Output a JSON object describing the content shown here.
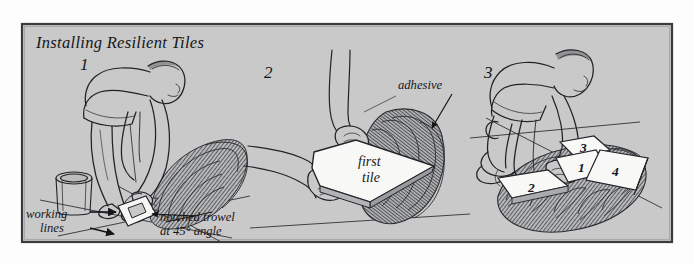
{
  "figure": {
    "title": "Installing Resilient Tiles",
    "kind": "instructional-line-drawing",
    "panel_count": 3,
    "colors": {
      "page": "#fdfdfd",
      "panel_background": "#c9c9c9",
      "frame_line": "#3a3b3f",
      "ink": "#202227",
      "tile_fill": "#f7f7f5",
      "adhesive_shadow": "#6f7175"
    }
  },
  "panels": [
    {
      "number": "1",
      "subject": "worker-spreading-adhesive",
      "labels": [
        {
          "name": "working-lines",
          "text": "working\nlines",
          "line1": "working",
          "line2": "lines",
          "arrows": 2
        },
        {
          "name": "notched-trowel",
          "text": "notched trowel\nat 45° angle",
          "line1": "notched trowel",
          "line2": "at 45° angle",
          "arrows": 1
        }
      ],
      "objects": [
        "bending-worker",
        "adhesive-bucket",
        "notched-trowel",
        "chalk-working-lines",
        "troweled-adhesive"
      ]
    },
    {
      "number": "2",
      "subject": "hands-placing-first-tile",
      "labels": [
        {
          "name": "adhesive",
          "text": "adhesive",
          "line1": "adhesive",
          "arrows": 1
        }
      ],
      "tiles": [
        {
          "label_line1": "first",
          "label_line2": "tile"
        }
      ],
      "objects": [
        "two-hands",
        "first-tile",
        "troweled-adhesive"
      ]
    },
    {
      "number": "3",
      "subject": "kneeling-worker-laying-tiles",
      "labels": [],
      "tiles": [
        {
          "number": "3"
        },
        {
          "number": "1"
        },
        {
          "number": "4"
        },
        {
          "number": "2"
        }
      ],
      "objects": [
        "kneeling-worker",
        "laid-tiles",
        "chalk-working-lines",
        "troweled-adhesive"
      ]
    }
  ]
}
